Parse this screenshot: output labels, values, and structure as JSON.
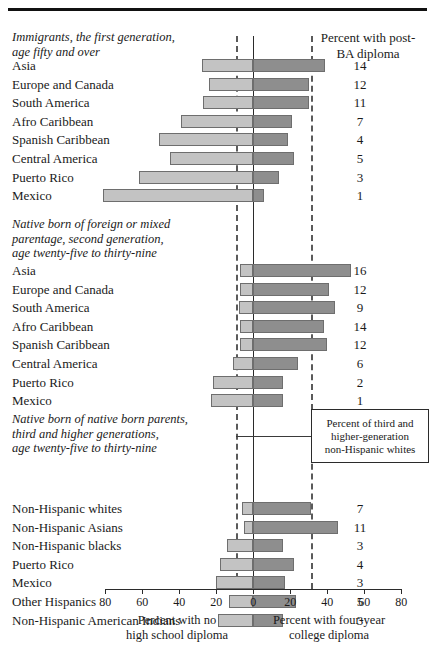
{
  "chart_data": {
    "type": "bar",
    "title": "",
    "orientation": "horizontal-diverging",
    "xlabel_left": "Percent with no\nhigh school diploma",
    "xlabel_right": "Percent with four-year\ncollege diploma",
    "value_column_header": "Percent with post-\nBA diploma",
    "xlim": [
      -80,
      80
    ],
    "xticks_left": [
      80,
      60,
      40,
      20
    ],
    "xticks_center": 0,
    "xticks_right": [
      20,
      40,
      60,
      80
    ],
    "grid": false,
    "reference_lines": {
      "zero": 0,
      "dashed_left_no_hs_diploma": 9.5,
      "dashed_right_college_diploma": 31
    },
    "annotation_box": "Percent of third and\nhigher-generation\nnon-Hispanic whites",
    "series": [
      {
        "name": "Percent with no high school diploma",
        "side": "left",
        "color": "#c3c3c3"
      },
      {
        "name": "Percent with four-year college diploma",
        "side": "right",
        "color": "#8e8e8e"
      }
    ],
    "sections": [
      {
        "title": "Immigrants, the first generation,\nage fifty and over",
        "rows": [
          {
            "category": "Asia",
            "no_hs": 28,
            "college": 39,
            "post_ba": 14
          },
          {
            "category": "Europe and Canada",
            "no_hs": 24,
            "college": 30,
            "post_ba": 12
          },
          {
            "category": "South America",
            "no_hs": 27,
            "college": 30,
            "post_ba": 11
          },
          {
            "category": "Afro Caribbean",
            "no_hs": 39,
            "college": 21,
            "post_ba": 7
          },
          {
            "category": "Spanish Caribbean",
            "no_hs": 51,
            "college": 19,
            "post_ba": 4
          },
          {
            "category": "Central America",
            "no_hs": 45,
            "college": 22,
            "post_ba": 5
          },
          {
            "category": "Puerto Rico",
            "no_hs": 62,
            "college": 14,
            "post_ba": 3
          },
          {
            "category": "Mexico",
            "no_hs": 81,
            "college": 6,
            "post_ba": 1
          }
        ]
      },
      {
        "title": "Native born of foreign or mixed\nparentage, second generation,\nage twenty-five to thirty-nine",
        "rows": [
          {
            "category": "Asia",
            "no_hs": 7,
            "college": 53,
            "post_ba": 16
          },
          {
            "category": "Europe and Canada",
            "no_hs": 7,
            "college": 41,
            "post_ba": 12
          },
          {
            "category": "South America",
            "no_hs": 8,
            "college": 44,
            "post_ba": 9
          },
          {
            "category": "Afro Caribbean",
            "no_hs": 7,
            "college": 38,
            "post_ba": 14
          },
          {
            "category": "Spanish Caribbean",
            "no_hs": 7,
            "college": 40,
            "post_ba": 12
          },
          {
            "category": "Central America",
            "no_hs": 11,
            "college": 24,
            "post_ba": 6
          },
          {
            "category": "Puerto Rico",
            "no_hs": 22,
            "college": 16,
            "post_ba": 2
          },
          {
            "category": "Mexico",
            "no_hs": 23,
            "college": 16,
            "post_ba": 1
          }
        ]
      },
      {
        "title": "Native born of native born parents,\nthird and higher generations,\nage twenty-five to thirty-nine",
        "rows": [
          {
            "category": "Non-Hispanic whites",
            "no_hs": 6,
            "college": 31,
            "post_ba": 7
          },
          {
            "category": "Non-Hispanic Asians",
            "no_hs": 5,
            "college": 46,
            "post_ba": 11
          },
          {
            "category": "Non-Hispanic blacks",
            "no_hs": 14,
            "college": 16,
            "post_ba": 3
          },
          {
            "category": "Puerto Rico",
            "no_hs": 18,
            "college": 22,
            "post_ba": 4
          },
          {
            "category": "Mexico",
            "no_hs": 20,
            "college": 17,
            "post_ba": 3
          },
          {
            "category": "Other Hispanics",
            "no_hs": 13,
            "college": 23,
            "post_ba": 5
          },
          {
            "category": "Non-Hispanic American Indians",
            "no_hs": 19,
            "college": 16,
            "post_ba": 3
          }
        ]
      }
    ]
  }
}
